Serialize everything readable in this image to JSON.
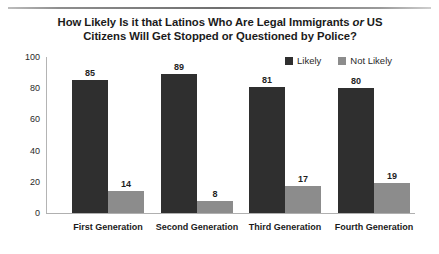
{
  "chart_data": {
    "type": "bar",
    "title": "How Likely Is it that Latinos Who Are Legal Immigrants or US Citizens Will Get Stopped or Questioned by Police?",
    "title_line1_pre": "How Likely Is it that Latinos Who Are Legal Immigrants ",
    "title_line1_italic": "or",
    "title_line1_post": " US",
    "title_line2": "Citizens Will Get Stopped or Questioned by Police?",
    "xlabel": "",
    "ylabel": "",
    "ylim": [
      0,
      100
    ],
    "yticks": [
      0,
      20,
      40,
      60,
      80,
      100
    ],
    "ytick_labels": [
      "0",
      "20",
      "40",
      "60",
      "80",
      "100"
    ],
    "grid": false,
    "legend_position": "top-right",
    "categories": [
      "First Generation",
      "Second Generation",
      "Third Generation",
      "Fourth Generation"
    ],
    "series": [
      {
        "name": "Likely",
        "color": "#2f2f2f",
        "values": [
          85,
          89,
          81,
          80
        ],
        "value_labels": [
          "85",
          "89",
          "81",
          "80"
        ]
      },
      {
        "name": "Not Likely",
        "color": "#8c8c8c",
        "values": [
          14,
          8,
          17,
          19
        ],
        "value_labels": [
          "14",
          "8",
          "17",
          "19"
        ]
      }
    ]
  }
}
